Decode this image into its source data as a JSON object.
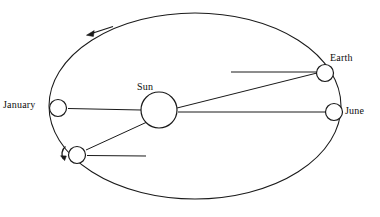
{
  "diagram": {
    "stroke_color": "#1a1a1a",
    "background_color": "#ffffff",
    "orbit": {
      "name": "orbit-ellipse",
      "center_x": 195,
      "center_y": 106,
      "radius_x": 146,
      "radius_y": 93,
      "style": "solid"
    },
    "bodies": [
      {
        "id": "sun",
        "label": "Sun",
        "cx": 159,
        "cy": 110,
        "r": 18,
        "label_position": "above"
      },
      {
        "id": "earth-january",
        "label": "January",
        "cx": 58,
        "cy": 108,
        "r": 9,
        "label_position": "left"
      },
      {
        "id": "earth-june",
        "label": "June",
        "cx": 334,
        "cy": 112,
        "r": 9,
        "label_position": "right"
      },
      {
        "id": "earth-upper-right",
        "label": "Earth",
        "cx": 325,
        "cy": 73,
        "r": 9,
        "label_position": "above-right"
      },
      {
        "id": "earth-lower-left",
        "label": "",
        "cx": 77,
        "cy": 155,
        "r": 9,
        "label_position": "none"
      }
    ],
    "axis_lines": [
      {
        "name": "axis-line-january",
        "x1": 68,
        "y1": 108,
        "x2": 141,
        "y2": 110
      },
      {
        "name": "axis-line-sun-to-june",
        "x1": 178,
        "y1": 112,
        "x2": 325,
        "y2": 112
      },
      {
        "name": "axis-line-sun-to-earth",
        "x1": 177,
        "y1": 107,
        "x2": 316,
        "y2": 73
      },
      {
        "name": "axis-line-earth-upper",
        "x1": 231,
        "y1": 72,
        "x2": 316,
        "y2": 72
      },
      {
        "name": "axis-line-sun-to-lower-left",
        "x1": 146,
        "y1": 122,
        "x2": 86,
        "y2": 150
      },
      {
        "name": "axis-line-lower-left",
        "x1": 87,
        "y1": 155,
        "x2": 146,
        "y2": 156
      }
    ],
    "arrows": [
      {
        "name": "orbit-direction-arrow",
        "description": "counterclockwise orbital direction arrow",
        "x1": 112,
        "y1": 27,
        "x2": 87,
        "y2": 35
      },
      {
        "name": "rotation-direction-arrow",
        "description": "axial rotation direction arrow at lower-left Earth",
        "x": 62,
        "y": 150
      }
    ]
  },
  "labels": {
    "january": "January",
    "sun": "Sun",
    "earth": "Earth",
    "june": "June"
  }
}
